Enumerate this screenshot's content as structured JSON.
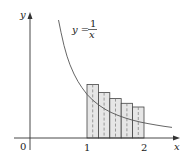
{
  "diagram": {
    "function_label": {
      "lhs": "y =",
      "numerator": "1",
      "denominator": "x"
    },
    "axis_labels": {
      "x": "x",
      "y": "y"
    },
    "tick_labels": {
      "origin": "0",
      "one": "1",
      "two": "2"
    },
    "rectangles": {
      "count": 5,
      "interval": [
        1,
        2
      ],
      "method": "midpoint",
      "midpoints": [
        1.1,
        1.3,
        1.5,
        1.7,
        1.9
      ],
      "heights": [
        0.909,
        0.769,
        0.667,
        0.588,
        0.526
      ]
    },
    "colors": {
      "fill": "#e6e6e6",
      "stroke": "#444444",
      "curve": "#555555",
      "axis": "#333333"
    }
  }
}
